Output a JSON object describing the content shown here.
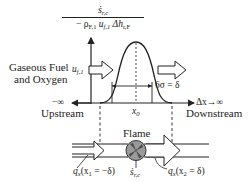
{
  "figure": {
    "type": "flame-profile-diagram",
    "y_axis_label": {
      "numerator": "ṡ",
      "numerator_sub": "r,c",
      "denominator_prefix": "− ρ",
      "denominator_rho_sub": "F,1",
      "denominator_u": " u",
      "denominator_u_sub": "f,1",
      "denominator_dh": " Δh",
      "denominator_dh_sub": "r,F"
    },
    "inlet_label_line1": "Gaseous Fuel",
    "inlet_label_line2": "and Oxygen",
    "velocity_label": "u",
    "velocity_sub": "f,1",
    "width_label": "6σ = δ",
    "x_axis_left": "−∞",
    "x_axis_right": "Δx→∞",
    "center_label": "x",
    "center_sub": "0",
    "upstream_label": "Upstream",
    "downstream_label": "Downstream",
    "flame_label": "Flame",
    "source_label": "ṡ",
    "source_sub": "r,c",
    "q_in_label": "q",
    "q_in_sub": "x",
    "q_in_arg": "(x",
    "q_in_arg_sub": "1",
    "q_in_arg_rest": " = −δ)",
    "q_out_label": "q",
    "q_out_sub": "x",
    "q_out_arg": "(x",
    "q_out_arg_sub": "2",
    "q_out_arg_rest": " = δ)"
  },
  "colors": {
    "line": "#222222",
    "flame_fill": "#9a9a9a",
    "flame_dark": "#555555"
  }
}
